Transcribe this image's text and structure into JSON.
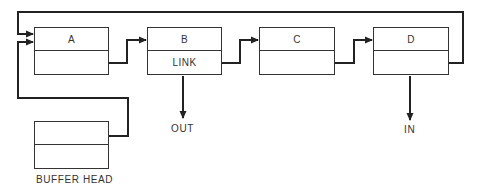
{
  "diagram": {
    "type": "buffer-ring-linked-list",
    "nodes": [
      {
        "id": "A",
        "top_label": "A",
        "bottom_label": ""
      },
      {
        "id": "B",
        "top_label": "B",
        "bottom_label": "LINK"
      },
      {
        "id": "C",
        "top_label": "C",
        "bottom_label": ""
      },
      {
        "id": "D",
        "top_label": "D",
        "bottom_label": ""
      }
    ],
    "buffer_head": {
      "top_label": "",
      "bottom_label": "",
      "caption": "BUFFER HEAD"
    },
    "outputs": {
      "out_label": "OUT",
      "in_label": "IN"
    },
    "edges": [
      {
        "from": "A",
        "to": "B"
      },
      {
        "from": "B",
        "to": "C"
      },
      {
        "from": "C",
        "to": "D"
      },
      {
        "from": "D",
        "to": "A",
        "route": "top-loop"
      },
      {
        "from": "BUFFER HEAD",
        "to": "A"
      },
      {
        "from": "B",
        "to": "OUT"
      },
      {
        "from": "D",
        "to": "IN"
      }
    ],
    "line_color": "#222222"
  }
}
